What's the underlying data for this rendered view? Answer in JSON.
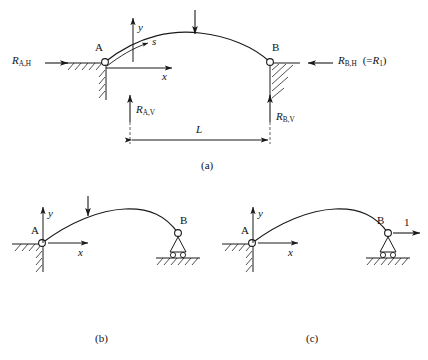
{
  "figure": {
    "stroke_color": "#1a1a1a",
    "background": "#ffffff"
  },
  "panels": [
    {
      "id": "a",
      "caption": "(a)",
      "description": "Two-hinged arch with horizontal and vertical reactions at supports A and B",
      "nodes": [
        {
          "name": "A",
          "label": "A",
          "support": "pin"
        },
        {
          "name": "B",
          "label": "B",
          "support": "pin"
        }
      ],
      "axes": {
        "x_label": "x",
        "y_label": "y",
        "arc_length_label": "s"
      },
      "loads": [
        {
          "name": "point-load",
          "label": "",
          "direction": "down"
        }
      ],
      "reactions": [
        {
          "name": "reaction-a-horizontal",
          "symbol": "R",
          "subscript": "A,H",
          "direction": "right"
        },
        {
          "name": "reaction-a-vertical",
          "symbol": "R",
          "subscript": "A,V",
          "direction": "up"
        },
        {
          "name": "reaction-b-horizontal",
          "symbol": "R",
          "subscript": "B,H",
          "direction": "left",
          "note_symbol": "R",
          "note_subscript": "1",
          "note_prefix": "(=",
          "note_suffix": ")"
        },
        {
          "name": "reaction-b-vertical",
          "symbol": "R",
          "subscript": "B,V",
          "direction": "up"
        }
      ],
      "dimension": {
        "name": "span-dimension",
        "label": "L"
      }
    },
    {
      "id": "b",
      "caption": "(b)",
      "description": "Primary released structure: pin at A, roller at B, under applied point load",
      "nodes": [
        {
          "name": "A",
          "label": "A",
          "support": "pin"
        },
        {
          "name": "B",
          "label": "B",
          "support": "roller"
        }
      ],
      "axes": {
        "x_label": "x",
        "y_label": "y"
      },
      "loads": [
        {
          "name": "point-load",
          "label": "",
          "direction": "down"
        }
      ]
    },
    {
      "id": "c",
      "caption": "(c)",
      "description": "Released structure under unit horizontal load at B",
      "nodes": [
        {
          "name": "A",
          "label": "A",
          "support": "pin"
        },
        {
          "name": "B",
          "label": "B",
          "support": "roller"
        }
      ],
      "axes": {
        "x_label": "x",
        "y_label": "y"
      },
      "loads": [
        {
          "name": "unit-load",
          "label": "1",
          "direction": "right"
        }
      ]
    }
  ]
}
